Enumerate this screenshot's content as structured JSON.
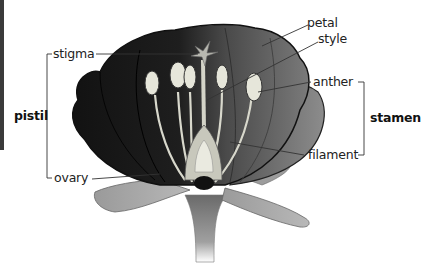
{
  "diagram": {
    "colors": {
      "petal_dark": "#1a1a1a",
      "petal_mid": "#555555",
      "petal_light": "#8a8a8a",
      "sepal": "#a8a8a8",
      "anther": "#dcdcd0",
      "stem": "#9a9a9a",
      "leader_line": "#333333"
    },
    "labels": {
      "stigma": "stigma",
      "ovary": "ovary",
      "pistil": "pistil",
      "petal": "petal",
      "style": "style",
      "anther": "anther",
      "filament": "filament",
      "stamen": "stamen"
    },
    "groups": {
      "pistil": [
        "stigma",
        "ovary"
      ],
      "stamen": [
        "anther",
        "filament"
      ]
    }
  }
}
